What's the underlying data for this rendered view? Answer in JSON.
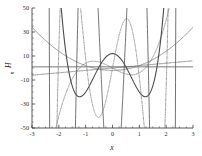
{
  "chart_data": {
    "type": "line",
    "title": "",
    "xlabel": "x",
    "ylabel": "H",
    "ylabel_subscript": "n",
    "xlim": [
      -3,
      3
    ],
    "ylim": [
      -50,
      50
    ],
    "xticks": [
      -3,
      -2,
      -1,
      0,
      1,
      2,
      3
    ],
    "xticklabels": [
      "-3",
      "-2",
      "-1",
      "0",
      "1",
      "2",
      "3"
    ],
    "yticks": [
      -50,
      -30,
      -10,
      10,
      30,
      50
    ],
    "yticklabels": [
      "-50",
      "-30",
      "-10",
      "10",
      "30",
      "50"
    ],
    "x_minor_tick_step": 0.25,
    "y_minor_tick_step": 5,
    "grid": false,
    "legend_position": "none",
    "series": [
      {
        "name": "H0",
        "label": "H_0(x) = 1",
        "color": "#3a3a3a",
        "dash": "none",
        "width": 0.75,
        "formula": "1",
        "x": [
          -3,
          -2,
          -1,
          0,
          1,
          2,
          3
        ],
        "values": [
          1,
          1,
          1,
          1,
          1,
          1,
          1
        ]
      },
      {
        "name": "H1",
        "label": "H_1(x) = 2x",
        "color": "#555555",
        "dash": "dashdot",
        "width": 0.7,
        "formula": "2*x",
        "x": [
          -3,
          -2,
          -1,
          0,
          1,
          2,
          3
        ],
        "values": [
          -6,
          -4,
          -2,
          0,
          2,
          4,
          6
        ]
      },
      {
        "name": "H2",
        "label": "H_2(x) = 4x^2 - 2",
        "color": "#8a8a8a",
        "dash": "none",
        "width": 1.0,
        "formula": "4*x*x - 2",
        "x": [
          -3,
          -2.5,
          -2,
          -1.5,
          -1,
          -0.5,
          0,
          0.5,
          1,
          1.5,
          2,
          2.5,
          3
        ],
        "values": [
          34,
          23,
          14,
          7,
          2,
          -1,
          -2,
          -1,
          2,
          7,
          14,
          23,
          34
        ]
      },
      {
        "name": "H3",
        "label": "H_3(x) = 8x^3 - 12x",
        "color": "#6e6e6e",
        "dash": "dashdot",
        "width": 0.7,
        "formula": "8*x^3 - 12*x",
        "x": [
          -2,
          -1.5,
          -1,
          -0.707,
          -0.5,
          0,
          0.5,
          0.707,
          1,
          1.5,
          2
        ],
        "values": [
          -40,
          -9,
          4,
          5.66,
          5,
          0,
          -5,
          -5.66,
          -4,
          9,
          40
        ]
      },
      {
        "name": "H4",
        "label": "H_4(x) = 16x^4 - 48x^2 + 12",
        "color": "#4a4a4a",
        "dash": "none",
        "width": 1.1,
        "formula": "16*x^4 - 48*x^2 + 12",
        "x": [
          -2,
          -1.5,
          -1.22,
          -1,
          -0.5,
          0,
          0.5,
          1,
          1.22,
          1.5,
          2
        ],
        "values": [
          172,
          -15,
          -24,
          -20,
          -1,
          12,
          -1,
          -20,
          -24,
          -15,
          172
        ]
      },
      {
        "name": "H5",
        "label": "H_5(x) = 32x^5 - 160x^3 + 120x",
        "color": "#7d7d7d",
        "dash": "dashdot",
        "width": 0.75,
        "formula": "32*x^5 - 160*x^3 + 120*x",
        "x": [
          -2,
          -1.6,
          -1.25,
          -1,
          -0.5,
          0,
          0.5,
          1,
          1.25,
          1.6,
          2
        ],
        "values": [
          -136,
          -42,
          14,
          8,
          -1,
          0,
          1,
          -8,
          -14,
          42,
          136
        ]
      },
      {
        "name": "H6",
        "label": "H_6(x) = 64x^6 - 480x^4 + 720x^2 - 120",
        "color": "#5a5a5a",
        "dash": "none",
        "width": 0.85,
        "formula": "64*x^6 - 480*x^4 + 720*x^2 - 120",
        "x": [
          -2.2,
          -1.8,
          -1.5,
          -1.15,
          -0.8,
          -0.4,
          0,
          0.4,
          0.8,
          1.15,
          1.5,
          1.8,
          2.2
        ],
        "values": [
          300,
          -20,
          -33,
          -10,
          9,
          -60,
          -120,
          -60,
          9,
          -10,
          -33,
          -20,
          300
        ]
      }
    ]
  },
  "figure": {
    "background_color": "#ffffff",
    "axis_color": "#2b2b2b",
    "frame": "left-bottom"
  }
}
